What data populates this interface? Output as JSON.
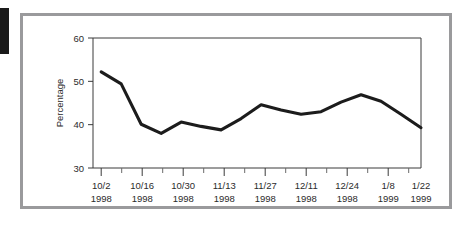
{
  "chart_data": {
    "type": "line",
    "title": "",
    "xlabel": "",
    "ylabel": "Percentage",
    "ylim": [
      30,
      60
    ],
    "yticks": [
      30,
      40,
      50,
      60
    ],
    "ytick_labels": [
      "30",
      "40",
      "50",
      "60"
    ],
    "grid": false,
    "legend": false,
    "x": [
      "10/2/1998",
      "10/9/1998",
      "10/16/1998",
      "10/23/1998",
      "10/30/1998",
      "11/6/1998",
      "11/13/1998",
      "11/20/1998",
      "11/27/1998",
      "12/4/1998",
      "12/11/1998",
      "12/18/1998",
      "12/24/1998",
      "12/31/1998",
      "1/8/1999",
      "1/15/1999",
      "1/22/1999"
    ],
    "values": [
      52.2,
      49.4,
      40.1,
      38.0,
      40.6,
      39.6,
      38.8,
      41.4,
      44.6,
      43.4,
      42.4,
      43.0,
      45.2,
      46.9,
      45.4,
      42.4,
      39.3
    ],
    "xtick_labels": [
      {
        "date": "10/2",
        "year": "1998"
      },
      {
        "date": "10/16",
        "year": "1998"
      },
      {
        "date": "10/30",
        "year": "1998"
      },
      {
        "date": "11/13",
        "year": "1998"
      },
      {
        "date": "11/27",
        "year": "1998"
      },
      {
        "date": "12/11",
        "year": "1998"
      },
      {
        "date": "12/24",
        "year": "1998"
      },
      {
        "date": "1/8",
        "year": "1999"
      },
      {
        "date": "1/22",
        "year": "1999"
      }
    ],
    "line_color": "#1c1c1c",
    "axis_color": "#3a3a3a",
    "frame_color": "#9a9a9c"
  }
}
